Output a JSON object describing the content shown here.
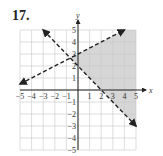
{
  "problem": {
    "number": "17."
  },
  "chart_data": {
    "type": "line",
    "title": "",
    "xlabel": "x",
    "ylabel": "y",
    "xlim": [
      -5,
      5
    ],
    "ylim": [
      -5,
      5
    ],
    "grid": true,
    "x_ticks": [
      "-5",
      "-4",
      "-3",
      "-2",
      "-1",
      "1",
      "2",
      "3",
      "4",
      "5"
    ],
    "y_ticks": [
      "5",
      "4",
      "3",
      "2",
      "1",
      "-1",
      "-2",
      "-3",
      "-4",
      "-5"
    ],
    "series": [
      {
        "name": "boundary-1",
        "equation": "y = 0.5x + 3",
        "style": "dashed",
        "x": [
          -5,
          4
        ],
        "y": [
          0.5,
          5
        ],
        "arrows": "both"
      },
      {
        "name": "boundary-2",
        "equation": "y = -x + 2",
        "style": "dashed",
        "x": [
          -3,
          5
        ],
        "y": [
          5,
          -3
        ],
        "arrows": "both"
      }
    ],
    "shaded_region": {
      "description": "y < 0.5x + 3 and y > -x + 2",
      "vertices": [
        [
          -0.667,
          2.667
        ],
        [
          4,
          5
        ],
        [
          5,
          5
        ],
        [
          5,
          -3
        ]
      ],
      "color": "#d6d6d6"
    }
  }
}
